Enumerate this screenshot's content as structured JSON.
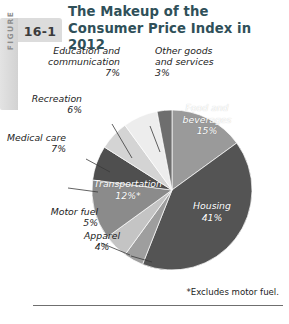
{
  "figure": {
    "word": "FIGURE",
    "number": "16-1"
  },
  "title": {
    "line1": "The Makeup of the",
    "line2": "Consumer Price Index in 2012"
  },
  "footnote": "*Excludes motor fuel.",
  "colors": {
    "title": "#2f5059",
    "tab": "#dcdcdc",
    "leader": "#3a3a3a",
    "rule": "#6f6f6f"
  },
  "chart_data": {
    "type": "pie",
    "title": "The Makeup of the Consumer Price Index in 2012",
    "note": "*Excludes motor fuel.",
    "total": 100,
    "units": "percent",
    "start_angle_deg": -90,
    "direction": "clockwise",
    "categories": [
      "Food and beverages",
      "Housing",
      "Apparel",
      "Motor fuel",
      "Transportation",
      "Medical care",
      "Recreation",
      "Education and communication",
      "Other goods and services"
    ],
    "values": [
      15,
      41,
      4,
      5,
      12,
      7,
      6,
      7,
      3
    ],
    "slices": [
      {
        "label": "Food and beverages",
        "value": 15,
        "display": "15%",
        "color": "#9a9a9a",
        "label_placement": "inside",
        "label_color": "#ffffff"
      },
      {
        "label": "Housing",
        "value": 41,
        "display": "41%",
        "color": "#545454",
        "label_placement": "inside",
        "label_color": "#ffffff"
      },
      {
        "label": "Apparel",
        "value": 4,
        "display": "4%",
        "color": "#9e9e9e",
        "label_placement": "outside",
        "label_color": "#1d1d1d"
      },
      {
        "label": "Motor fuel",
        "value": 5,
        "display": "5%",
        "color": "#c4c4c4",
        "label_placement": "outside",
        "label_color": "#1d1d1d"
      },
      {
        "label": "Transportation",
        "value": 12,
        "display": "12%*",
        "color": "#8b8b8b",
        "label_placement": "inside",
        "label_color": "#ffffff"
      },
      {
        "label": "Medical care",
        "value": 7,
        "display": "7%",
        "color": "#4f4f4f",
        "label_placement": "outside",
        "label_color": "#1d1d1d"
      },
      {
        "label": "Recreation",
        "value": 6,
        "display": "6%",
        "color": "#d4d4d4",
        "label_placement": "outside",
        "label_color": "#1d1d1d"
      },
      {
        "label": "Education and communication",
        "value": 7,
        "display": "7%",
        "color": "#ededed",
        "label_placement": "outside",
        "label_color": "#1d1d1d"
      },
      {
        "label": "Other goods and services",
        "value": 3,
        "display": "3%",
        "color": "#6e6e6e",
        "label_placement": "outside",
        "label_color": "#1d1d1d"
      }
    ],
    "labels_inside": {
      "food": "Food and\nbeverages\n15%",
      "housing": "Housing\n41%",
      "transportation": "Transportation\n12%*"
    },
    "labels_outside": {
      "other_goods": "Other goods\nand services\n3%",
      "education": "Education and\ncommunication\n7%",
      "recreation": "Recreation\n6%",
      "medical": "Medical care\n7%",
      "motor_fuel": "Motor fuel\n5%",
      "apparel": "Apparel\n4%"
    },
    "legend": "none",
    "grid": false
  }
}
